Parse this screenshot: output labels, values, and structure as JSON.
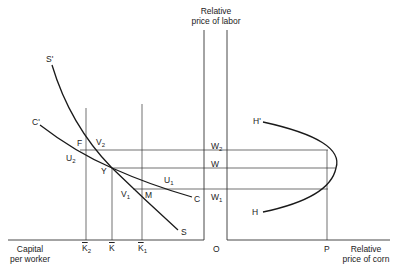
{
  "diagram": {
    "axes": {
      "y_axis_label_line1": "Relative",
      "y_axis_label_line2": "price of labor",
      "left_x_axis_label_line1": "Capital",
      "left_x_axis_label_line2": "per worker",
      "right_x_axis_label_line1": "Relative",
      "right_x_axis_label_line2": "price of corn",
      "origin": "O"
    },
    "capital_ticks": [
      {
        "base": "K",
        "sub": "2"
      },
      {
        "base": "K",
        "sub": ""
      },
      {
        "base": "K",
        "sub": "1"
      }
    ],
    "wage_labels": [
      {
        "base": "W",
        "sub": "2"
      },
      {
        "base": "W",
        "sub": ""
      },
      {
        "base": "W",
        "sub": "1"
      }
    ],
    "price_tick": "P",
    "curves": {
      "S_start": "S'",
      "S_end": "S",
      "C_start": "C'",
      "C_end": "C",
      "H_start": "H'",
      "H_end": "H"
    },
    "points": {
      "F": "F",
      "V2": {
        "base": "V",
        "sub": "2"
      },
      "U2": {
        "base": "U",
        "sub": "2"
      },
      "Y": "Y",
      "U1": {
        "base": "U",
        "sub": "1"
      },
      "V1": {
        "base": "V",
        "sub": "1"
      },
      "M": "M"
    },
    "colors": {
      "line": "#1a1a1a",
      "guide": "#333333",
      "background": "#ffffff"
    }
  }
}
